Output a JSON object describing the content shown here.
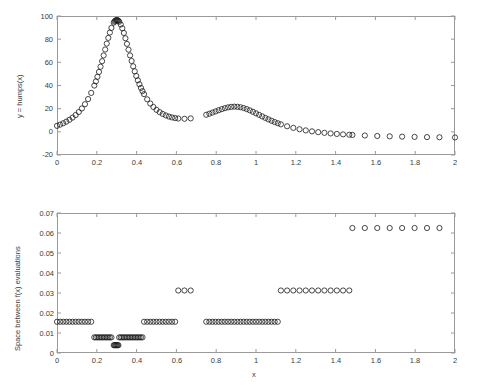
{
  "figure": {
    "background": "#ffffff",
    "axis_color": "#9a9a9a",
    "marker_color": "#1a1a1a",
    "marker_shape": "open-circle"
  },
  "chart_data": [
    {
      "id": "top",
      "type": "scatter",
      "title": "",
      "xlabel": "",
      "ylabel": "y = humps(x)",
      "xlim": [
        0,
        2
      ],
      "ylim": [
        -20,
        100
      ],
      "xticks": [
        0,
        0.2,
        0.4,
        0.6,
        0.8,
        1,
        1.2,
        1.4,
        1.6,
        1.8,
        2
      ],
      "xticklabels": [
        "0",
        "0.2",
        "0.4",
        "0.6",
        "0.8",
        "1",
        "1.2",
        "1.4",
        "1.6",
        "1.8",
        "2"
      ],
      "yticks": [
        -20,
        0,
        20,
        40,
        60,
        80,
        100
      ],
      "yticklabels": [
        "-20",
        "0",
        "20",
        "40",
        "60",
        "80",
        "100"
      ],
      "grid": false,
      "legend": null,
      "marker": "o",
      "series_name": "humps(x) evaluation points",
      "function": "humps",
      "description": "y = 1/((x-0.3)^2+0.01) + 1/((x-0.9)^2+0.04) - 6, sampled at adaptively refined x locations",
      "x": [
        0,
        0.015625,
        0.03125,
        0.046875,
        0.0625,
        0.078125,
        0.09375,
        0.109375,
        0.125,
        0.140625,
        0.15625,
        0.171875,
        0.1875,
        0.1953125,
        0.203125,
        0.2109375,
        0.21875,
        0.2265625,
        0.234375,
        0.2421875,
        0.25,
        0.2578125,
        0.265625,
        0.2734375,
        0.28125,
        0.28515625,
        0.2890625,
        0.29296875,
        0.296875,
        0.30078125,
        0.3046875,
        0.30859375,
        0.3125,
        0.3203125,
        0.328125,
        0.3359375,
        0.34375,
        0.3515625,
        0.359375,
        0.3671875,
        0.375,
        0.3828125,
        0.390625,
        0.3984375,
        0.40625,
        0.4140625,
        0.421875,
        0.4296875,
        0.4375,
        0.453125,
        0.46875,
        0.484375,
        0.5,
        0.515625,
        0.53125,
        0.546875,
        0.5625,
        0.578125,
        0.59375,
        0.609375,
        0.625,
        0.65625,
        0.6875,
        0.71875,
        0.75,
        0.765625,
        0.78125,
        0.796875,
        0.8125,
        0.828125,
        0.84375,
        0.859375,
        0.875,
        0.890625,
        0.90625,
        0.921875,
        0.9375,
        0.953125,
        0.96875,
        0.984375,
        1.0,
        1.015625,
        1.03125,
        1.046875,
        1.0625,
        1.078125,
        1.09375,
        1.109375,
        1.125,
        1.15625,
        1.1875,
        1.21875,
        1.25,
        1.28125,
        1.3125,
        1.34375,
        1.375,
        1.40625,
        1.4375,
        1.46875,
        1.5,
        1.5625,
        1.625,
        1.6875,
        1.75,
        1.8125,
        1.875,
        1.9375,
        2.0
      ],
      "y": [
        3.96,
        5.01,
        6.31,
        7.95,
        10.05,
        12.8,
        16.49,
        21.59,
        28.88,
        39.58,
        55.13,
        74.86,
        91.25,
        95.08,
        96.32,
        95.23,
        92.12,
        87.45,
        81.66,
        75.18,
        68.41,
        61.68,
        55.24,
        49.27,
        43.88,
        41.43,
        96.3,
        98.8,
        99.91,
        99.66,
        98.09,
        95.32,
        91.5,
        81.66,
        70.87,
        60.34,
        50.78,
        42.56,
        35.76,
        30.26,
        25.88,
        22.43,
        19.73,
        17.64,
        16.03,
        14.79,
        13.86,
        13.17,
        12.67,
        12.08,
        11.8,
        11.7,
        11.72,
        11.82,
        11.96,
        12.12,
        12.29,
        12.45,
        12.6,
        12.74,
        12.86,
        13.29,
        13.94,
        14.86,
        16.08,
        16.8,
        17.58,
        18.41,
        19.26,
        20.08,
        20.81,
        21.37,
        21.69,
        21.73,
        21.46,
        20.9,
        20.09,
        19.09,
        17.95,
        16.75,
        15.52,
        14.32,
        13.17,
        12.09,
        11.1,
        10.21,
        9.41,
        8.69,
        8.06,
        7.01,
        6.17,
        5.49,
        4.94,
        4.48,
        4.1,
        3.78,
        3.51,
        3.27,
        3.07,
        2.89,
        2.73,
        2.45,
        2.22,
        2.03,
        1.86,
        1.72,
        1.6,
        1.49,
        1.39
      ],
      "dense_cluster_note": "Markers near x = 0.2832 to 0.3125 overlap so densely they render as a solid black cap at the peak (y near 100)."
    },
    {
      "id": "bottom",
      "type": "scatter",
      "title": "",
      "xlabel": "x",
      "ylabel": "Space between f(x) evaluations",
      "xlim": [
        0,
        2
      ],
      "ylim": [
        0,
        0.07
      ],
      "xticks": [
        0,
        0.2,
        0.4,
        0.6,
        0.8,
        1,
        1.2,
        1.4,
        1.6,
        1.8,
        2
      ],
      "xticklabels": [
        "0",
        "0.2",
        "0.4",
        "0.6",
        "0.8",
        "1",
        "1.2",
        "1.4",
        "1.6",
        "1.8",
        "2"
      ],
      "yticks": [
        0,
        0.01,
        0.02,
        0.03,
        0.04,
        0.05,
        0.06,
        0.07
      ],
      "yticklabels": [
        "0",
        "0.01",
        "0.02",
        "0.03",
        "0.04",
        "0.05",
        "0.06",
        "0.07"
      ],
      "grid": false,
      "legend": null,
      "marker": "o",
      "series_name": "step size between successive f(x) evaluations",
      "step_levels": [
        0.0625,
        0.03125,
        0.015625,
        0.0078125,
        0.00390625
      ],
      "segments": [
        {
          "level": 0.015625,
          "x_start": 0.0,
          "x_end": 0.1796875,
          "count": 12
        },
        {
          "level": 0.0078125,
          "x_start": 0.1875,
          "x_end": 0.2734375,
          "count": 12
        },
        {
          "level": 0.00390625,
          "x_start": 0.28515625,
          "x_end": 0.30859375,
          "count": 7
        },
        {
          "level": 0.0078125,
          "x_start": 0.3125,
          "x_end": 0.4296875,
          "count": 16
        },
        {
          "level": 0.015625,
          "x_start": 0.4375,
          "x_end": 0.6015625,
          "count": 12
        },
        {
          "level": 0.03125,
          "x_start": 0.609375,
          "x_end": 0.6875,
          "count": 4
        },
        {
          "level": 0.015625,
          "x_start": 0.75,
          "x_end": 1.109375,
          "count": 24
        },
        {
          "level": 0.03125,
          "x_start": 1.125,
          "x_end": 1.46875,
          "count": 12
        },
        {
          "level": 0.0625,
          "x_start": 1.484375,
          "x_end": 1.9375,
          "count": 8
        }
      ],
      "dense_cluster_note": "The 0.0039 segment near x = 0.3 is a tight black cluster of overlapping markers."
    }
  ]
}
